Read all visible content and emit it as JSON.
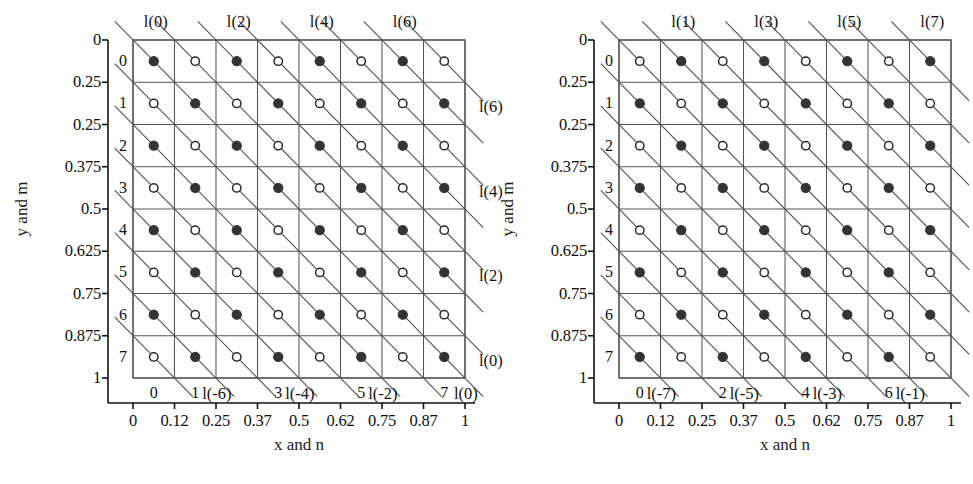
{
  "figure": {
    "type": "lattice-diagram",
    "width": 973,
    "height": 484,
    "background": "#ffffff",
    "line_color": "#555555",
    "marker_fill_color": "#333333",
    "marker_open_color": "#ffffff"
  },
  "chart_data": {
    "type": "scatter",
    "title": "",
    "xlabel": "x and n",
    "ylabel": "y and m",
    "grid": true,
    "legend": "none",
    "xlim": [
      0,
      1
    ],
    "ylim": [
      0,
      1
    ],
    "x_ticks": [
      "0",
      "0.12",
      "0.25",
      "0.37",
      "0.5",
      "0.62",
      "0.75",
      "0.87",
      "1"
    ],
    "x_tick_values": [
      0,
      0.125,
      0.25,
      0.375,
      0.5,
      0.625,
      0.75,
      0.875,
      1
    ],
    "y_ticks": [
      "0",
      "0.25",
      "0.25",
      "0.375",
      "0.5",
      "0.625",
      "0.75",
      "0.875",
      "1"
    ],
    "y_tick_values": [
      0,
      0.125,
      0.25,
      0.375,
      0.5,
      0.625,
      0.75,
      0.875,
      1
    ],
    "n_indices": [
      0,
      1,
      2,
      3,
      4,
      5,
      6,
      7
    ],
    "m_indices": [
      0,
      1,
      2,
      3,
      4,
      5,
      6,
      7
    ],
    "grid_size": 8,
    "panels": [
      {
        "id": "left",
        "parity": "even",
        "description": "Filled markers where (m + n) is even",
        "diagonal_labels_top": [
          "l(0)",
          "l(2)",
          "l(4)",
          "l(6)"
        ],
        "diagonal_labels_top_col": [
          0,
          2,
          4,
          6
        ],
        "diagonal_labels_right": [
          "l(6)",
          "l(4)",
          "l(2)",
          "l(0)"
        ],
        "diagonal_labels_right_row": [
          1,
          3,
          5,
          7
        ],
        "diagonal_labels_bottom": [
          "l(-6)",
          "l(-4)",
          "l(-2)",
          "l(0)"
        ],
        "diagonal_labels_bottom_col": [
          2,
          4,
          6,
          8
        ],
        "bottom_index_labels": [
          "0",
          "1",
          "3",
          "5",
          "7"
        ],
        "bottom_index_cols": [
          0,
          1,
          3,
          5,
          7
        ]
      },
      {
        "id": "right",
        "parity": "odd",
        "description": "Filled markers where (m + n) is odd",
        "diagonal_labels_top": [
          "l(1)",
          "l(3)",
          "l(5)",
          "l(7)"
        ],
        "diagonal_labels_top_col": [
          1,
          3,
          5,
          7
        ],
        "diagonal_labels_right": [],
        "diagonal_labels_right_row": [],
        "diagonal_labels_bottom": [
          "l(-7)",
          "l(-5)",
          "l(-3)",
          "l(-1)"
        ],
        "diagonal_labels_bottom_col": [
          1,
          3,
          5,
          7
        ],
        "bottom_index_labels": [
          "0",
          "2",
          "4",
          "6"
        ],
        "bottom_index_cols": [
          0,
          2,
          4,
          6
        ]
      }
    ]
  }
}
